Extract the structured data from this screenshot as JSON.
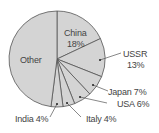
{
  "chart_data": {
    "type": "pie",
    "title": "",
    "slices": [
      {
        "label": "China",
        "value": 18
      },
      {
        "label": "USSR",
        "value": 13
      },
      {
        "label": "Japan",
        "value": 7
      },
      {
        "label": "USA",
        "value": 6
      },
      {
        "label": "Italy",
        "value": 4
      },
      {
        "label": "India",
        "value": 4
      },
      {
        "label": "Other",
        "value": 48
      }
    ],
    "start_angle": "12 o'clock",
    "direction": "clockwise",
    "fill_color": "#d4d4d4",
    "edge_color": "#555555"
  },
  "labels": {
    "china": "China",
    "china_pct": "18%",
    "ussr": "USSR",
    "ussr_pct": "13%",
    "japan": "Japan 7%",
    "usa": "USA 6%",
    "italy": "Italy 4%",
    "india": "India 4%",
    "other": "Other"
  }
}
